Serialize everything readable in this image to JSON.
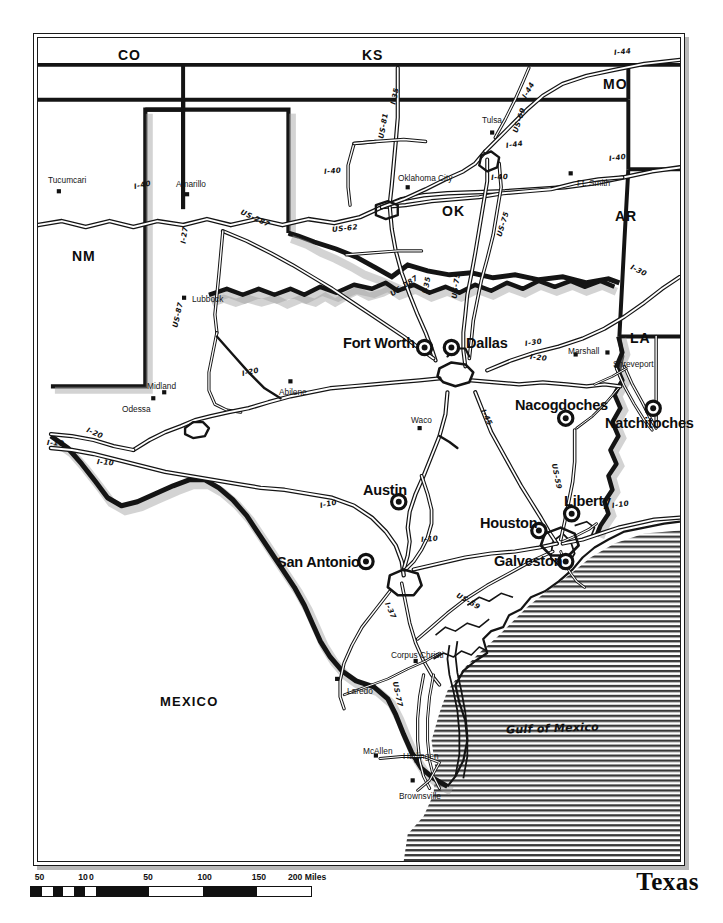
{
  "map": {
    "title": "Texas",
    "gulf_label": "Gulf of Mexico",
    "scale": {
      "unit_label": "200 Miles",
      "ticks": [
        "50",
        "10",
        "0",
        "50",
        "100",
        "150",
        "200 Miles"
      ],
      "tick_values": [
        -50,
        -10,
        0,
        50,
        100,
        150,
        200
      ]
    },
    "states": [
      {
        "abbr": "CO",
        "x": 116,
        "y": 46
      },
      {
        "abbr": "KS",
        "x": 360,
        "y": 46
      },
      {
        "abbr": "MO",
        "x": 601,
        "y": 75
      },
      {
        "abbr": "OK",
        "x": 440,
        "y": 202
      },
      {
        "abbr": "AR",
        "x": 613,
        "y": 207
      },
      {
        "abbr": "NM",
        "x": 70,
        "y": 247
      },
      {
        "abbr": "LA",
        "x": 628,
        "y": 329
      }
    ],
    "countries": [
      {
        "abbr": "MEXICO",
        "x": 158,
        "y": 693
      }
    ],
    "major_cities": [
      {
        "name": "Fort Worth",
        "label_x": 341,
        "label_y": 334,
        "dot_x": 425,
        "dot_y": 347,
        "ring": true
      },
      {
        "name": "Dallas",
        "label_x": 464,
        "label_y": 334,
        "dot_x": 452,
        "dot_y": 347,
        "ring": true
      },
      {
        "name": "Nacogdoches",
        "label_x": 513,
        "label_y": 396,
        "dot_x": 567,
        "dot_y": 418,
        "ring": true
      },
      {
        "name": "Natchitoches",
        "label_x": 603,
        "label_y": 414,
        "dot_x": 655,
        "dot_y": 408,
        "ring": true
      },
      {
        "name": "Austin",
        "label_x": 361,
        "label_y": 481,
        "dot_x": 399,
        "dot_y": 502,
        "ring": true
      },
      {
        "name": "Liberty",
        "label_x": 562,
        "label_y": 492,
        "dot_x": 573,
        "dot_y": 514,
        "ring": true
      },
      {
        "name": "Houston",
        "label_x": 478,
        "label_y": 514,
        "dot_x": 540,
        "dot_y": 531,
        "ring": true
      },
      {
        "name": "San Antonio",
        "label_x": 275,
        "label_y": 553,
        "dot_x": 366,
        "dot_y": 562,
        "ring": true
      },
      {
        "name": "Galveston",
        "label_x": 492,
        "label_y": 552,
        "dot_x": 567,
        "dot_y": 562,
        "ring": true
      }
    ],
    "minor_cities": [
      {
        "name": "Tucumcari",
        "label_x": 46,
        "label_y": 174,
        "dot_x": 57,
        "dot_y": 190
      },
      {
        "name": "Amarillo",
        "label_x": 174,
        "label_y": 178,
        "dot_x": 186,
        "dot_y": 193
      },
      {
        "name": "Tulsa",
        "label_x": 480,
        "label_y": 114,
        "dot_x": 493,
        "dot_y": 131
      },
      {
        "name": "Oklahoma City",
        "label_x": 396,
        "label_y": 172,
        "dot_x": 408,
        "dot_y": 186
      },
      {
        "name": "Ft. Smith",
        "label_x": 575,
        "label_y": 177,
        "dot_x": 572,
        "dot_y": 172
      },
      {
        "name": "Lubbock",
        "label_x": 190,
        "label_y": 293,
        "dot_x": 183,
        "dot_y": 297
      },
      {
        "name": "Marshall",
        "label_x": 566,
        "label_y": 345,
        "dot_x": 577,
        "dot_y": 354
      },
      {
        "name": "Shreveport",
        "label_x": 611,
        "label_y": 358,
        "dot_x": 609,
        "dot_y": 352
      },
      {
        "name": "Midland",
        "label_x": 145,
        "label_y": 380,
        "dot_x": 163,
        "dot_y": 392
      },
      {
        "name": "Abilene",
        "label_x": 277,
        "label_y": 386,
        "dot_x": 290,
        "dot_y": 381
      },
      {
        "name": "Odessa",
        "label_x": 120,
        "label_y": 403,
        "dot_x": 152,
        "dot_y": 398
      },
      {
        "name": "Waco",
        "label_x": 409,
        "label_y": 414,
        "dot_x": 420,
        "dot_y": 428
      },
      {
        "name": "Laredo",
        "label_x": 345,
        "label_y": 685,
        "dot_x": 337,
        "dot_y": 680
      },
      {
        "name": "Corpus Christi",
        "label_x": 389,
        "label_y": 649,
        "dot_x": 416,
        "dot_y": 662
      },
      {
        "name": "McAllen",
        "label_x": 361,
        "label_y": 745,
        "dot_x": 376,
        "dot_y": 757
      },
      {
        "name": "Harlingen",
        "label_x": 401,
        "label_y": 750,
        "dot_x": 417,
        "dot_y": 762
      },
      {
        "name": "Brownsville",
        "label_x": 397,
        "label_y": 790,
        "dot_x": 413,
        "dot_y": 782
      }
    ],
    "highway_labels": [
      {
        "name": "I-44",
        "x": 612,
        "y": 47,
        "rot": -6
      },
      {
        "name": "I-35",
        "x": 391,
        "y": 99,
        "rot": -78
      },
      {
        "name": "I-44",
        "x": 522,
        "y": 92,
        "rot": -60
      },
      {
        "name": "US-81",
        "x": 379,
        "y": 133,
        "rot": -80
      },
      {
        "name": "I-40",
        "x": 322,
        "y": 166,
        "rot": -5
      },
      {
        "name": "I-44",
        "x": 504,
        "y": 140,
        "rot": -8
      },
      {
        "name": "I-40",
        "x": 489,
        "y": 172,
        "rot": -4
      },
      {
        "name": "US-69",
        "x": 513,
        "y": 127,
        "rot": -72
      },
      {
        "name": "I-40",
        "x": 607,
        "y": 153,
        "rot": -7
      },
      {
        "name": "I-40",
        "x": 132,
        "y": 181,
        "rot": -12
      },
      {
        "name": "US-287",
        "x": 239,
        "y": 206,
        "rot": 25
      },
      {
        "name": "US-62",
        "x": 330,
        "y": 224,
        "rot": -6
      },
      {
        "name": "I-27",
        "x": 181,
        "y": 238,
        "rot": -82
      },
      {
        "name": "US-75",
        "x": 497,
        "y": 231,
        "rot": -73
      },
      {
        "name": "I-30",
        "x": 629,
        "y": 261,
        "rot": 27
      },
      {
        "name": "US-287",
        "x": 389,
        "y": 289,
        "rot": -34
      },
      {
        "name": "I-35",
        "x": 423,
        "y": 288,
        "rot": -80
      },
      {
        "name": "US-75",
        "x": 452,
        "y": 293,
        "rot": -82
      },
      {
        "name": "US-87",
        "x": 173,
        "y": 322,
        "rot": -78
      },
      {
        "name": "I-30",
        "x": 523,
        "y": 338,
        "rot": -8
      },
      {
        "name": "I-20",
        "x": 240,
        "y": 368,
        "rot": -12
      },
      {
        "name": "I-20",
        "x": 528,
        "y": 351,
        "rot": 6
      },
      {
        "name": "I-20",
        "x": 85,
        "y": 424,
        "rot": 24
      },
      {
        "name": "I-45",
        "x": 481,
        "y": 404,
        "rot": 64
      },
      {
        "name": "I-10",
        "x": 45,
        "y": 437,
        "rot": 3
      },
      {
        "name": "I-10",
        "x": 95,
        "y": 456,
        "rot": 5
      },
      {
        "name": "US-59",
        "x": 552,
        "y": 458,
        "rot": 78
      },
      {
        "name": "I-10",
        "x": 318,
        "y": 500,
        "rot": -12
      },
      {
        "name": "I-10",
        "x": 419,
        "y": 534,
        "rot": -5
      },
      {
        "name": "I-10",
        "x": 610,
        "y": 500,
        "rot": -8
      },
      {
        "name": "US-59",
        "x": 455,
        "y": 589,
        "rot": 30
      },
      {
        "name": "I-37",
        "x": 385,
        "y": 597,
        "rot": 66
      },
      {
        "name": "US-77",
        "x": 393,
        "y": 676,
        "rot": 78
      }
    ]
  }
}
